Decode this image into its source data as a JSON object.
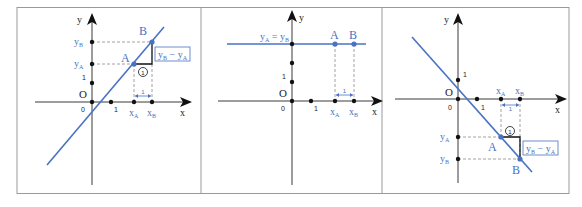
{
  "figure": {
    "panels": [
      {
        "id": "increasing",
        "axis_x_label": "x",
        "axis_y_label": "y",
        "origin_label": "O",
        "zero_label": "0",
        "unit_x_label": "1",
        "unit_y_label": "1",
        "point_a_label": "A",
        "point_b_label": "B",
        "xa_label": "x",
        "xa_sub": "A",
        "xb_label": "x",
        "xb_sub": "B",
        "ya_label": "y",
        "ya_sub": "A",
        "yb_label": "y",
        "yb_sub": "B",
        "delta_label": "y",
        "delta_sub1": "B",
        "delta_minus": " − y",
        "delta_sub2": "A",
        "circle_label": "1",
        "span_label": "1"
      },
      {
        "id": "constant",
        "axis_x_label": "x",
        "axis_y_label": "y",
        "origin_label": "O",
        "zero_label": "0",
        "unit_x_label": "1",
        "unit_y_label": "1",
        "point_a_label": "A",
        "point_b_label": "B",
        "xa_label": "x",
        "xa_sub": "A",
        "xb_label": "x",
        "xb_sub": "B",
        "equal_label_y1": "y",
        "equal_sub1": "A",
        "equal_eq": " = y",
        "equal_sub2": "B",
        "span_label": "1"
      },
      {
        "id": "decreasing",
        "axis_x_label": "x",
        "axis_y_label": "y",
        "origin_label": "O",
        "zero_label": "0",
        "unit_x_label": "1",
        "unit_y_label": "1",
        "point_a_label": "A",
        "point_b_label": "B",
        "xa_label": "x",
        "xa_sub": "A",
        "xb_label": "x",
        "xb_sub": "B",
        "ya_label": "y",
        "ya_sub": "A",
        "yb_label": "y",
        "yb_sub": "B",
        "delta_label": "y",
        "delta_sub1": "B",
        "delta_minus": " − y",
        "delta_sub2": "A",
        "circle_label": "1",
        "span_label": "1"
      }
    ],
    "colors": {
      "accent": "#4a72c4",
      "axis": "#3a3a3a",
      "frame": "#9a9a9a"
    }
  }
}
